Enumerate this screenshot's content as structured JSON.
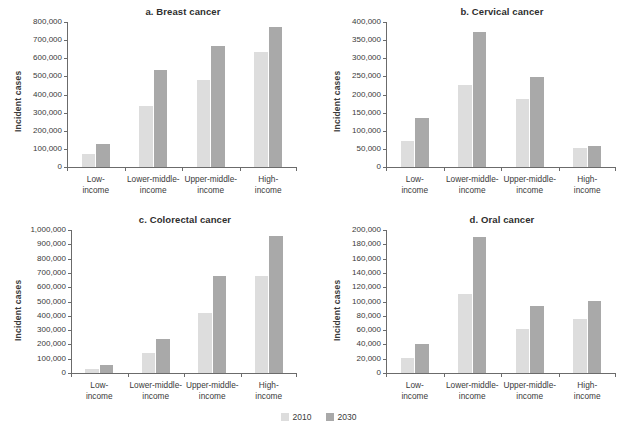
{
  "figure": {
    "background": "#ffffff",
    "series_colors": {
      "2010": "#dddddd",
      "2030": "#a9a9a9"
    },
    "axis_color": "#6b6b6b",
    "text_color": "#3a3a3a"
  },
  "legend": {
    "position": "bottom-center",
    "items": [
      {
        "label": "2010",
        "color": "#dddddd"
      },
      {
        "label": "2030",
        "color": "#a9a9a9"
      }
    ]
  },
  "categories": [
    "Low-\nincome",
    "Lower-middle-\nincome",
    "Upper-middle-\nincome",
    "High-\nincome"
  ],
  "category_lines": [
    [
      "Low-",
      "income"
    ],
    [
      "Lower-middle-",
      "income"
    ],
    [
      "Upper-middle-",
      "income"
    ],
    [
      "High-",
      "income"
    ]
  ],
  "chart_data": [
    {
      "id": "a",
      "type": "bar",
      "title": "a. Breast cancer",
      "xlabel": "",
      "ylabel": "Incident cases",
      "categories": [
        "Low-income",
        "Lower-middle-income",
        "Upper-middle-income",
        "High-income"
      ],
      "series": [
        {
          "name": "2010",
          "color": "#dddddd",
          "values": [
            72000,
            335000,
            480000,
            632000
          ]
        },
        {
          "name": "2030",
          "color": "#a9a9a9",
          "values": [
            127000,
            537000,
            668000,
            775000
          ]
        }
      ],
      "ylim": [
        0,
        800000
      ],
      "ytick_step": 100000,
      "ytick_labels": [
        "0",
        "100,000",
        "200,000",
        "300,000",
        "400,000",
        "500,000",
        "600,000",
        "700,000",
        "800,000"
      ],
      "grid": false,
      "legend_position": "figure-bottom"
    },
    {
      "id": "b",
      "type": "bar",
      "title": "b. Cervical cancer",
      "xlabel": "",
      "ylabel": "Incident cases",
      "categories": [
        "Low-income",
        "Lower-middle-income",
        "Upper-middle-income",
        "High-income"
      ],
      "series": [
        {
          "name": "2010",
          "color": "#dddddd",
          "values": [
            73000,
            226000,
            188000,
            52000
          ]
        },
        {
          "name": "2030",
          "color": "#a9a9a9",
          "values": [
            136000,
            373000,
            248000,
            57000
          ]
        }
      ],
      "ylim": [
        0,
        400000
      ],
      "ytick_step": 50000,
      "ytick_labels": [
        "0",
        "50,000",
        "100,000",
        "150,000",
        "200,000",
        "250,000",
        "300,000",
        "350,000",
        "400,000"
      ],
      "grid": false,
      "legend_position": "figure-bottom"
    },
    {
      "id": "c",
      "type": "bar",
      "title": "c. Colorectal cancer",
      "xlabel": "",
      "ylabel": "Incident cases",
      "categories": [
        "Low-income",
        "Lower-middle-income",
        "Upper-middle-income",
        "High-income"
      ],
      "series": [
        {
          "name": "2010",
          "color": "#dddddd",
          "values": [
            30000,
            137000,
            420000,
            677000
          ]
        },
        {
          "name": "2030",
          "color": "#a9a9a9",
          "values": [
            55000,
            235000,
            680000,
            960000
          ]
        }
      ],
      "ylim": [
        0,
        1000000
      ],
      "ytick_step": 100000,
      "ytick_labels": [
        "0",
        "100,000",
        "200,000",
        "300,000",
        "400,000",
        "500,000",
        "600,000",
        "700,000",
        "800,000",
        "900,000",
        "1,000,000"
      ],
      "grid": false,
      "legend_position": "figure-bottom"
    },
    {
      "id": "d",
      "type": "bar",
      "title": "d. Oral cancer",
      "xlabel": "",
      "ylabel": "Incident cases",
      "categories": [
        "Low-income",
        "Lower-middle-income",
        "Upper-middle-income",
        "High-income"
      ],
      "series": [
        {
          "name": "2010",
          "color": "#dddddd",
          "values": [
            21000,
            110000,
            61000,
            76000
          ]
        },
        {
          "name": "2030",
          "color": "#a9a9a9",
          "values": [
            40000,
            190000,
            94000,
            101000
          ]
        }
      ],
      "ylim": [
        0,
        200000
      ],
      "ytick_step": 20000,
      "ytick_labels": [
        "0",
        "20,000",
        "40,000",
        "60,000",
        "80,000",
        "100,000",
        "120,000",
        "140,000",
        "160,000",
        "180,000",
        "200,000"
      ],
      "grid": false,
      "legend_position": "figure-bottom"
    }
  ]
}
